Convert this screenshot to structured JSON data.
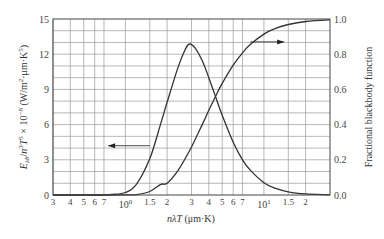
{
  "chart_data": {
    "type": "line",
    "title": "",
    "xlabel": "nλT (μm·K)",
    "ylabel_left": "E_λb/n³T⁵ × 10⁻⁸ (W/m²·μm·K⁵)",
    "ylabel_right": "Fractional blackbody function",
    "x_scale": "log",
    "x_range": [
      0.3,
      30
    ],
    "x_unit_note": "thousands of μm·K (tick labels: 3,4,5,6,7,10^0,1.5,2,3,4,5,6,7,10^1,1.5,2)",
    "ylim_left": [
      0,
      15
    ],
    "ylim_right": [
      0.0,
      1.0
    ],
    "grid": true,
    "legend": "none (arrows indicate axis for each curve)",
    "x_ticks": [
      {
        "value": 0.3,
        "label": "3"
      },
      {
        "value": 0.4,
        "label": "4"
      },
      {
        "value": 0.5,
        "label": "5"
      },
      {
        "value": 0.6,
        "label": "6"
      },
      {
        "value": 0.7,
        "label": "7"
      },
      {
        "value": 1.0,
        "label": "10",
        "sup": "0"
      },
      {
        "value": 1.5,
        "label": "1.5"
      },
      {
        "value": 2.0,
        "label": "2"
      },
      {
        "value": 3.0,
        "label": "3"
      },
      {
        "value": 4.0,
        "label": "4"
      },
      {
        "value": 5.0,
        "label": "5"
      },
      {
        "value": 6.0,
        "label": "6"
      },
      {
        "value": 7.0,
        "label": "7"
      },
      {
        "value": 10.0,
        "label": "10",
        "sup": "1"
      },
      {
        "value": 15.0,
        "label": "1.5"
      },
      {
        "value": 20.0,
        "label": "2"
      }
    ],
    "y_left_ticks": [
      "0",
      "3",
      "6",
      "9",
      "12",
      "15"
    ],
    "y_right_ticks": [
      "0.0",
      "0.2",
      "0.4",
      "0.6",
      "0.8",
      "1.0"
    ],
    "series": [
      {
        "name": "Spectral emissive power E_λb/n³T⁵",
        "axis": "left",
        "x": [
          0.3,
          0.6,
          0.8,
          1.0,
          1.2,
          1.5,
          1.8,
          2.0,
          2.4,
          2.7,
          2.898,
          3.2,
          3.6,
          4.0,
          4.5,
          5.0,
          6.0,
          7.0,
          8.0,
          10.0,
          12.0,
          15.0,
          20.0,
          30.0
        ],
        "values": [
          0.0,
          0.0,
          0.05,
          0.21,
          0.91,
          3.1,
          6.1,
          7.9,
          10.9,
          12.4,
          12.87,
          12.5,
          11.4,
          10.0,
          8.3,
          6.8,
          4.5,
          3.0,
          2.1,
          1.05,
          0.58,
          0.27,
          0.095,
          0.02
        ],
        "peak": {
          "x": 2.898,
          "y": 12.87
        }
      },
      {
        "name": "Fractional blackbody function F(0→nλT)",
        "axis": "right",
        "x": [
          0.3,
          0.8,
          1.0,
          1.2,
          1.5,
          1.8,
          2.0,
          2.4,
          2.898,
          3.2,
          3.6,
          4.0,
          4.5,
          5.0,
          6.0,
          7.0,
          8.0,
          10.0,
          12.0,
          15.0,
          20.0,
          30.0
        ],
        "values": [
          0.0,
          0.0,
          0.0003,
          0.0021,
          0.0197,
          0.0605,
          0.0667,
          0.14,
          0.25,
          0.318,
          0.403,
          0.481,
          0.564,
          0.634,
          0.738,
          0.808,
          0.856,
          0.914,
          0.945,
          0.969,
          0.986,
          0.995
        ]
      }
    ],
    "annotations": [
      {
        "type": "arrow",
        "direction": "left",
        "points_to": "left axis",
        "at_x_range": [
          0.75,
          1.5
        ],
        "y_left": 4.2
      },
      {
        "type": "arrow",
        "direction": "right",
        "points_to": "right axis",
        "at_x_range": [
          8.0,
          14.0
        ],
        "y_right": 0.87
      }
    ]
  },
  "colors": {
    "curve": "#333333",
    "grid": "#9a9a9a",
    "axis": "#444444",
    "text": "#333333"
  }
}
